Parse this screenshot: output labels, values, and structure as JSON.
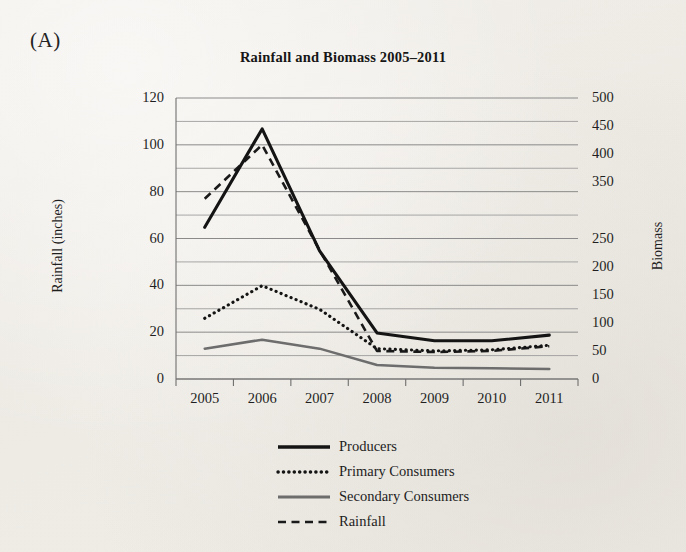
{
  "panel": {
    "label": "(A)"
  },
  "chart_data": {
    "type": "line",
    "title": "Rainfall and Biomass 2005–2011",
    "xlabel": "",
    "ylabel": "Rainfall (inches)",
    "y2label": "Biomass",
    "x": [
      "2005",
      "2006",
      "2007",
      "2008",
      "2009",
      "2010",
      "2011"
    ],
    "categories": [
      "2005",
      "2006",
      "2007",
      "2008",
      "2009",
      "2010",
      "2011"
    ],
    "ylim": [
      0,
      120
    ],
    "yticks": [
      0,
      20,
      40,
      60,
      80,
      100,
      120
    ],
    "ytick_labels": [
      "0",
      "20",
      "40",
      "60",
      "80",
      "100",
      "120"
    ],
    "y_minor_step": 10,
    "y2lim": [
      0,
      500
    ],
    "y2ticks": [
      0,
      50,
      100,
      150,
      200,
      250,
      300,
      350,
      400,
      450,
      500
    ],
    "y2tick_labels": [
      "0",
      "50",
      "100",
      "150",
      "200",
      "250",
      "",
      "350",
      "400",
      "450",
      "500"
    ],
    "grid": true,
    "legend_position": "bottom",
    "series": [
      {
        "name": "Producers",
        "axis": "right",
        "style": "solid-thick",
        "color": "#141414",
        "values": [
          270,
          445,
          228,
          82,
          68,
          68,
          78
        ],
        "values_left_axis": [
          65,
          107,
          55,
          20,
          16,
          16,
          19
        ]
      },
      {
        "name": "Primary Consumers",
        "axis": "right",
        "style": "dotted",
        "color": "#141414",
        "values": [
          108,
          166,
          124,
          54,
          50,
          52,
          60
        ],
        "values_left_axis": [
          26,
          40,
          30,
          13,
          12,
          12.5,
          14.5
        ]
      },
      {
        "name": "Secondary Consumers",
        "axis": "right",
        "style": "solid-gray",
        "color": "#6d6d6d",
        "values": [
          54,
          70,
          54,
          25,
          20,
          19,
          18
        ],
        "values_left_axis": [
          13,
          17,
          13,
          6,
          4.8,
          4.5,
          4.3
        ]
      },
      {
        "name": "Rainfall",
        "axis": "left",
        "style": "dashed",
        "color": "#1a1a1a",
        "values": [
          77,
          100,
          55,
          12,
          11.5,
          12,
          14
        ],
        "values_left_axis": [
          77,
          100,
          55,
          12,
          11.5,
          12,
          14
        ]
      }
    ]
  },
  "legend": {
    "items": [
      {
        "label": "Producers"
      },
      {
        "label": "Primary Consumers"
      },
      {
        "label": "Secondary Consumers"
      },
      {
        "label": "Rainfall"
      }
    ]
  }
}
